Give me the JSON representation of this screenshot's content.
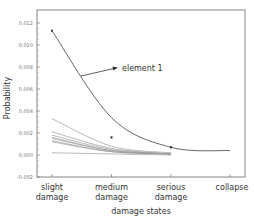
{
  "chart_data": {
    "type": "line",
    "title": "",
    "xlabel": "damage states",
    "ylabel": "Probability",
    "categories": [
      [
        "slight",
        "damage"
      ],
      [
        "medium",
        "damage"
      ],
      [
        "serious",
        "damage"
      ],
      [
        "collapse"
      ]
    ],
    "ylim": [
      -0.002,
      0.0125
    ],
    "yticks": [
      "0.012",
      "0.010",
      "0.008",
      "0.006",
      "0.004",
      "0.002",
      "0.000",
      "-0.002"
    ],
    "ytick_values": [
      0.012,
      0.01,
      0.008,
      0.006,
      0.004,
      0.002,
      0.0,
      -0.002
    ],
    "grid": false,
    "legend": "none",
    "annotations": [
      {
        "text": "element 1",
        "points_to_series": "element 1",
        "arrow": true
      }
    ],
    "series": [
      {
        "name": "element 1",
        "values": [
          0.0113,
          0.0034,
          0.0007,
          0.0004
        ],
        "emphasis": true
      },
      {
        "name": "element 2",
        "values": [
          0.0033,
          0.0008,
          0.0002,
          0.0001
        ]
      },
      {
        "name": "element 3",
        "values": [
          0.0021,
          0.0006,
          0.0001,
          0.0
        ]
      },
      {
        "name": "element 4",
        "values": [
          0.0018,
          0.0005,
          0.0001,
          0.0
        ]
      },
      {
        "name": "element 5",
        "values": [
          0.0016,
          0.0004,
          0.0001,
          0.0
        ]
      },
      {
        "name": "element 6",
        "values": [
          0.0015,
          0.0004,
          0.0001,
          0.0
        ]
      },
      {
        "name": "element 7",
        "values": [
          0.0013,
          0.0003,
          0.0001,
          0.0
        ]
      },
      {
        "name": "element 8",
        "values": [
          0.0012,
          0.0003,
          0.0001,
          0.0
        ]
      },
      {
        "name": "element 9",
        "values": [
          0.0002,
          0.0001,
          0.0,
          0.0
        ]
      }
    ],
    "scatter_points": [
      {
        "category": "medium damage",
        "value": 0.0016
      },
      {
        "category": "serious damage",
        "value": 0.0007
      }
    ]
  },
  "colors": {
    "main_line": "#555555",
    "thin_lines": "#9a9a9a",
    "axis": "#555555",
    "text": "#333333"
  }
}
